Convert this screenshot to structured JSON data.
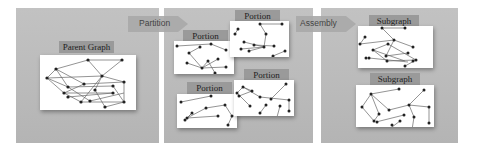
{
  "diagram": {
    "stages": [
      {
        "id": "parent",
        "cards": [
          {
            "label": "Parent Graph"
          }
        ]
      },
      {
        "id": "partition",
        "cards": [
          {
            "label": "Portion"
          },
          {
            "label": "Portion"
          },
          {
            "label": "Portion"
          },
          {
            "label": "Portion"
          }
        ]
      },
      {
        "id": "assembly",
        "cards": [
          {
            "label": "Subgraph"
          },
          {
            "label": "Subgraph"
          }
        ]
      }
    ],
    "arrows": [
      {
        "label": "Partition"
      },
      {
        "label": "Assembly"
      }
    ]
  },
  "colors": {
    "panel": "#bcbcbc",
    "label_bg": "#9a9a9a",
    "card": "#ffffff",
    "edge": "#555555",
    "node": "#222222"
  }
}
